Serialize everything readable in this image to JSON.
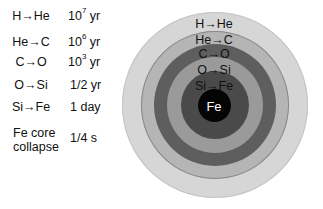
{
  "table": {
    "rows": [
      {
        "process": "H→He",
        "time_base": "10",
        "time_exp": "7",
        "time_unit": "yr"
      },
      {
        "process": "He→C",
        "time_base": "10",
        "time_exp": "6",
        "time_unit": "yr"
      },
      {
        "process": "C→O",
        "time_base": "10",
        "time_exp": "3",
        "time_unit": "yr"
      },
      {
        "process": "O→Si",
        "time_base": "1/2 yr",
        "time_exp": "",
        "time_unit": ""
      },
      {
        "process": "Si→Fe",
        "time_base": "1 day",
        "time_exp": "",
        "time_unit": ""
      },
      {
        "process_line1": "Fe core",
        "process_line2": "collapse",
        "time_base": "1/4 s"
      }
    ]
  },
  "diagram": {
    "layers": [
      {
        "label": "H→He",
        "color": "#d6d6d6"
      },
      {
        "label": "He→C",
        "color": "#b5b5b5"
      },
      {
        "label": "C→O",
        "color": "#5e5e5e"
      },
      {
        "label": "O→Si",
        "color": "#9a9a9a"
      },
      {
        "label": "Si→Fe",
        "color": "#4a4a4a"
      },
      {
        "label": "Fe",
        "color": "#050505"
      }
    ]
  }
}
